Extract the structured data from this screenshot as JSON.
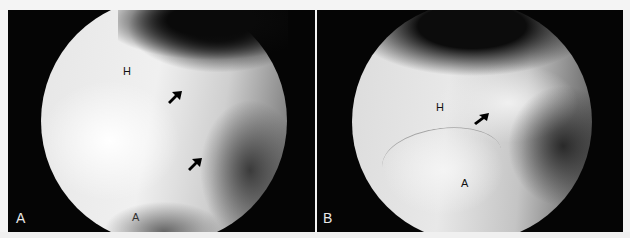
{
  "figure": {
    "panels": [
      {
        "id": "A",
        "panel_label": "A",
        "labels": [
          {
            "text": "H",
            "meaning": "humeral head"
          },
          {
            "text": "A",
            "meaning": "anterior structure"
          }
        ],
        "arrow_count": 2
      },
      {
        "id": "B",
        "panel_label": "B",
        "labels": [
          {
            "text": "H",
            "meaning": "humeral head"
          },
          {
            "text": "A",
            "meaning": "anterior structure"
          }
        ],
        "arrow_count": 1
      }
    ],
    "colors": {
      "background": "#f4f4f4",
      "panel_bg": "#050505",
      "tissue_light": "#f2f2f2",
      "tissue_dark": "#1a1a1a",
      "label_text": "#111111",
      "panel_label_text": "#e8e8e8"
    }
  }
}
